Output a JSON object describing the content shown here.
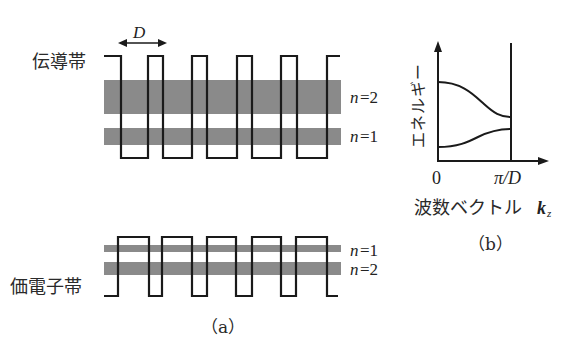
{
  "figure": {
    "panel_a": {
      "caption": "（a）",
      "conduction_label": "伝導帯",
      "valence_label": "価電子帯",
      "period_label": "D",
      "conduction_bands": [
        {
          "label_n": "n",
          "label_eq": "=2"
        },
        {
          "label_n": "n",
          "label_eq": "=1"
        }
      ],
      "valence_bands": [
        {
          "label_n": "n",
          "label_eq": "=1"
        },
        {
          "label_n": "n",
          "label_eq": "=2"
        }
      ]
    },
    "panel_b": {
      "caption": "（b）",
      "y_label": "エネルギー",
      "x_label": "波数ベクトル",
      "x_var": "k",
      "x_var_sub": "z",
      "x_tick_0": "0",
      "x_tick_end": "π/D"
    },
    "colors": {
      "band_fill": "#8a8a8a",
      "line": "#1a1a1a",
      "background": "#ffffff"
    }
  }
}
